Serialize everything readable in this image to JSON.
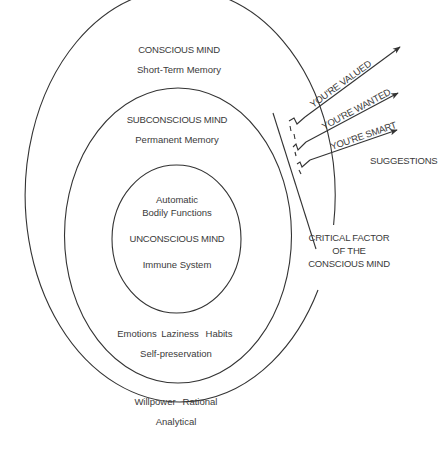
{
  "diagram": {
    "outer_ring": {
      "title": "CONSCIOUS MIND",
      "subtitle": "Short-Term Memory",
      "traits_line1_a": "Willpower",
      "traits_line1_b": "Rational",
      "traits_line2": "Analytical"
    },
    "middle_ring": {
      "title": "SUBCONSCIOUS MIND",
      "subtitle": "Permanent Memory",
      "traits_line1_a": "Emotions",
      "traits_line1_b": "Laziness",
      "traits_line1_c": "Habits",
      "traits_line2": "Self-preservation"
    },
    "inner_ring": {
      "line1": "Automatic",
      "line2": "Bodily Functions",
      "title": "UNCONSCIOUS MIND",
      "subtitle": "Immune System"
    },
    "critical_factor": {
      "line1": "CRITICAL FACTOR",
      "line2": "OF THE",
      "line3": "CONSCIOUS MIND"
    },
    "suggestions": {
      "label": "SUGGESTIONS",
      "arrows": [
        {
          "label": "YOU'RE VALUED"
        },
        {
          "label": "YOU'RE WANTED"
        },
        {
          "label": "YOU'RE SMART"
        }
      ]
    },
    "colors": {
      "stroke": "#333333",
      "text": "#3a3a3a",
      "background": "#ffffff"
    }
  }
}
